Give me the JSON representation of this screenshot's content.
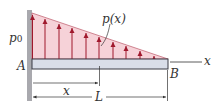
{
  "diagram": {
    "type": "cantilever beam with linearly varying distributed load",
    "labels": {
      "p0": "p",
      "p0_sub": "0",
      "px": "p(x)",
      "A": "A",
      "B": "B",
      "x_axis": "x",
      "x_dim": "x",
      "L_dim": "L"
    },
    "colors": {
      "load_fill": "#f6d2d8",
      "load_arrow": "#a0192d",
      "beam_fill": "#d9dde8",
      "beam_stroke": "#3a3a45",
      "wall": "#a9a9ae",
      "line": "#333333"
    }
  }
}
